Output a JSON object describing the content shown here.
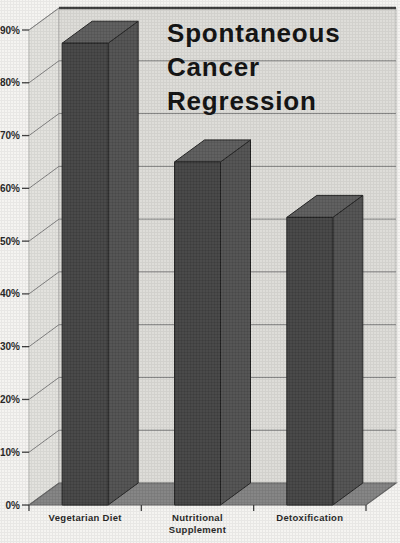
{
  "chart_data": {
    "type": "bar",
    "style": "3d-column",
    "title": "Spontaneous Cancer Regression",
    "title_lines": [
      "Spontaneous",
      "Cancer",
      "Regression"
    ],
    "categories": [
      "Vegetarian Diet",
      "Nutritional Supplement",
      "Detoxification"
    ],
    "category_label_lines": [
      [
        "Vegetarian Diet"
      ],
      [
        "Nutritional",
        "Supplement"
      ],
      [
        "Detoxification"
      ]
    ],
    "values": [
      87.5,
      65,
      54.5
    ],
    "value_unit": "%",
    "xlabel": "",
    "ylabel": "",
    "ylim": [
      0,
      90
    ],
    "ytick_step": 10,
    "ytick_labels": [
      "0%",
      "10%",
      "20%",
      "30%",
      "40%",
      "50%",
      "60%",
      "70%",
      "80%",
      "90%"
    ],
    "grid": true,
    "legend": false,
    "colors": {
      "page_bg": "#f4f3f0",
      "back_wall": "#dcdbd7",
      "side_wall": "#e1e0dc",
      "wall_edge": "#b5b5b2",
      "floor": "#7f7f7f",
      "floor_edge": "#5e5e5e",
      "gridline": "#7c7c7c",
      "top_edge": "#3a3a3a",
      "axis_tick": "#3a3a3a",
      "bar_front": "#404040",
      "bar_side": "#4d4d4d",
      "bar_top": "#585858",
      "bar_edge": "#1e1e1e",
      "title_color": "#0c0c0c",
      "label_color": "#1d1d1d"
    }
  }
}
